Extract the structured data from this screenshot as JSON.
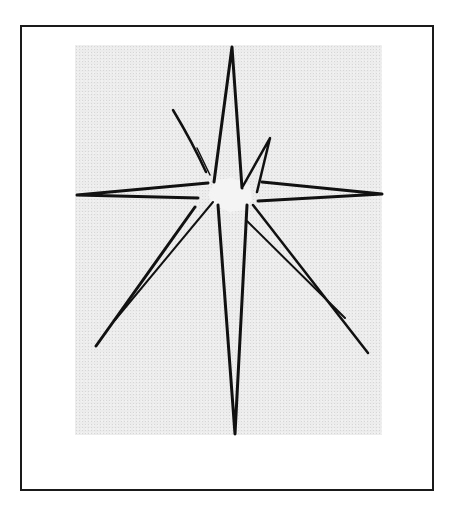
{
  "figure": {
    "colors": {
      "frame": "#1a1a1a",
      "panel": "#ececec",
      "stroke": "#111111",
      "star_fill": "#f4f4f4"
    }
  }
}
